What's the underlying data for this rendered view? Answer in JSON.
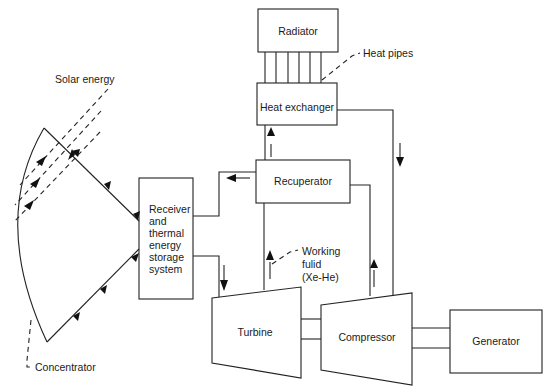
{
  "diagram": {
    "type": "solar dynamic power system schematic",
    "components": {
      "radiator": "Radiator",
      "heat_pipes": "Heat pipes",
      "heat_exchanger": "Heat exchanger",
      "recuperator": "Recuperator",
      "receiver": [
        "Receiver",
        "and",
        "thermal",
        "energy",
        "storage",
        "system"
      ],
      "turbine": "Turbine",
      "compressor": "Compressor",
      "generator": "Generator",
      "concentrator": "Concentrator",
      "solar_energy": "Solar energy",
      "working_fluid": [
        "Working",
        "fulid",
        "(Xe-He)"
      ]
    },
    "flows": [
      {
        "from": "Solar energy",
        "to": "Concentrator"
      },
      {
        "from": "Concentrator",
        "to": "Receiver and thermal energy storage system"
      },
      {
        "from": "Receiver and thermal energy storage system",
        "to": "Turbine"
      },
      {
        "from": "Turbine",
        "to": "Recuperator"
      },
      {
        "from": "Recuperator",
        "to": "Receiver and thermal energy storage system"
      },
      {
        "from": "Recuperator",
        "to": "Heat exchanger"
      },
      {
        "from": "Heat exchanger",
        "to": "Compressor"
      },
      {
        "from": "Compressor",
        "to": "Recuperator"
      },
      {
        "from": "Heat exchanger",
        "to": "Radiator",
        "via": "Heat pipes"
      },
      {
        "from": "Turbine",
        "to": "Compressor",
        "via": "shaft"
      },
      {
        "from": "Compressor",
        "to": "Generator",
        "via": "shaft"
      }
    ]
  }
}
